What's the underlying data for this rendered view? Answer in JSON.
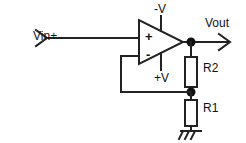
{
  "diagram": {
    "type": "schematic",
    "stroke_color": "#222222",
    "background_color": "#ffffff",
    "labels": {
      "input": "Vin+",
      "output": "Vout",
      "supply_negative": "-V",
      "supply_positive": "+V",
      "resistor_feedback": "R2",
      "resistor_ground": "R1",
      "opamp_noninverting_terminal": "+",
      "opamp_inverting_terminal": "-"
    },
    "components": [
      {
        "name": "opamp",
        "label": "",
        "kind": "triangle"
      },
      {
        "name": "resistor-r2",
        "label": "R2",
        "kind": "resistor"
      },
      {
        "name": "resistor-r1",
        "label": "R1",
        "kind": "resistor"
      },
      {
        "name": "ground",
        "label": "",
        "kind": "ground"
      }
    ],
    "nodes": [
      {
        "name": "output-node",
        "label": "Vout"
      },
      {
        "name": "feedback-node",
        "label": ""
      }
    ]
  }
}
